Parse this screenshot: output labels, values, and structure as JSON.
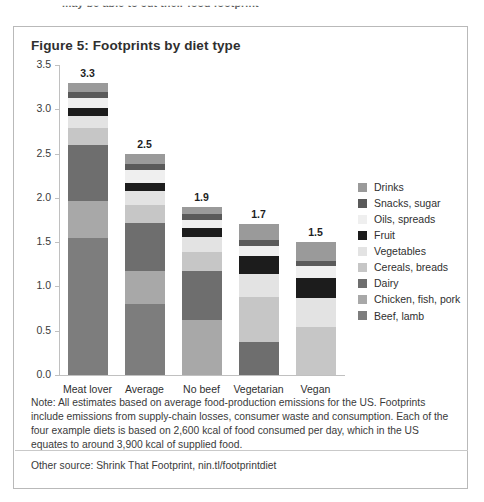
{
  "page": {
    "clipped_header_text": "may be able to cut their food footprint"
  },
  "figure": {
    "title": "Figure 5: Footprints by diet type",
    "note": "Note: All estimates based on average food-production emissions for the US. Footprints include emissions from supply-chain losses, consumer waste and consumption. Each of the four example diets is based on 2,600 kcal of food consumed per day, which in the US equates to around 3,900 kcal of supplied food.",
    "source": "Other source: Shrink That Footprint, nin.tl/footprintdiet"
  },
  "chart_data": {
    "type": "bar",
    "subtype": "stacked-bar",
    "title": "Figure 5: Footprints by diet type",
    "xlabel": "",
    "ylabel": "",
    "ylim": [
      0,
      3.5
    ],
    "ytick_labels": [
      "0.0",
      "0.5",
      "1.0",
      "1.5",
      "2.0",
      "2.5",
      "3.0",
      "3.5"
    ],
    "ytick_values": [
      0.0,
      0.5,
      1.0,
      1.5,
      2.0,
      2.5,
      3.0,
      3.5
    ],
    "grid": false,
    "legend_position": "right",
    "categories": [
      "Meat lover",
      "Average",
      "No beef",
      "Vegetarian",
      "Vegan"
    ],
    "totals": [
      3.3,
      2.5,
      1.9,
      1.7,
      1.5
    ],
    "total_labels": [
      "3.3",
      "2.5",
      "1.9",
      "1.7",
      "1.5"
    ],
    "stack_order_bottom_to_top": [
      "Beef, lamb",
      "Chicken, fish, pork",
      "Dairy",
      "Cereals, breads",
      "Vegetables",
      "Fruit",
      "Oils, spreads",
      "Snacks, sugar",
      "Drinks"
    ],
    "series": [
      {
        "name": "Beef, lamb",
        "color": "#7d7d7d",
        "values": [
          1.55,
          0.8,
          0.0,
          0.0,
          0.0
        ]
      },
      {
        "name": "Chicken, fish, pork",
        "color": "#a8a8a8",
        "values": [
          0.42,
          0.38,
          0.62,
          0.0,
          0.0
        ]
      },
      {
        "name": "Dairy",
        "color": "#6e6e6e",
        "values": [
          0.63,
          0.54,
          0.55,
          0.37,
          0.0
        ]
      },
      {
        "name": "Cereals, breads",
        "color": "#c6c6c6",
        "values": [
          0.19,
          0.2,
          0.22,
          0.51,
          0.54
        ]
      },
      {
        "name": "Vegetables",
        "color": "#e3e3e3",
        "values": [
          0.14,
          0.16,
          0.17,
          0.26,
          0.33
        ]
      },
      {
        "name": "Fruit",
        "color": "#1c1c1c",
        "values": [
          0.08,
          0.09,
          0.1,
          0.2,
          0.23
        ]
      },
      {
        "name": "Oils, spreads",
        "color": "#efefef",
        "values": [
          0.12,
          0.14,
          0.09,
          0.12,
          0.13
        ]
      },
      {
        "name": "Snacks, sugar",
        "color": "#5a5a5a",
        "values": [
          0.07,
          0.07,
          0.07,
          0.06,
          0.06
        ]
      },
      {
        "name": "Drinks",
        "color": "#9a9a9a",
        "values": [
          0.1,
          0.12,
          0.08,
          0.18,
          0.21
        ]
      }
    ],
    "legend_entries_top_to_bottom": [
      {
        "label": "Drinks",
        "color": "#9a9a9a"
      },
      {
        "label": "Snacks, sugar",
        "color": "#5a5a5a"
      },
      {
        "label": "Oils, spreads",
        "color": "#efefef"
      },
      {
        "label": "Fruit",
        "color": "#1c1c1c"
      },
      {
        "label": "Vegetables",
        "color": "#e3e3e3"
      },
      {
        "label": "Cereals, breads",
        "color": "#c6c6c6"
      },
      {
        "label": "Dairy",
        "color": "#6e6e6e"
      },
      {
        "label": "Chicken, fish, pork",
        "color": "#a8a8a8"
      },
      {
        "label": "Beef, lamb",
        "color": "#7d7d7d"
      }
    ]
  }
}
